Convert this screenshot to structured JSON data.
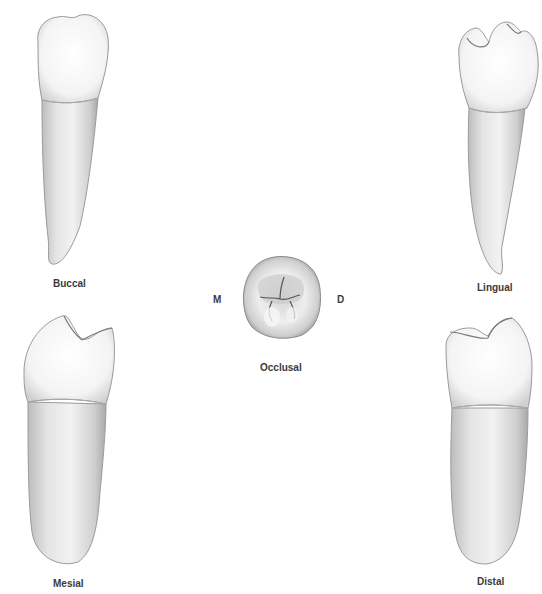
{
  "figure": {
    "views": [
      {
        "id": "buccal",
        "label": "Buccal"
      },
      {
        "id": "lingual",
        "label": "Lingual"
      },
      {
        "id": "mesial",
        "label": "Mesial"
      },
      {
        "id": "distal",
        "label": "Distal"
      },
      {
        "id": "occlusal",
        "label": "Occlusal"
      }
    ],
    "occlusal_orientation": {
      "left": "M",
      "right": "D"
    },
    "colors": {
      "background": "#ffffff",
      "crown_light": "#fbfbfb",
      "crown_shadow": "#d9d9d9",
      "root_light": "#ececec",
      "root_shadow": "#b9b9b9",
      "outline": "#8a8a8a",
      "label_text": "#3a3a3a"
    }
  }
}
